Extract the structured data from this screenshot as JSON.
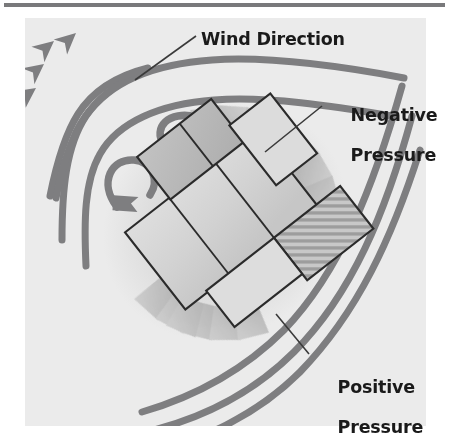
{
  "figure": {
    "type": "diagram",
    "panel_background_color": "#ebebeb",
    "page_background_color": "#ffffff",
    "rule_color": "#6e6e70",
    "flow_line_color": "#7a7a7c",
    "building_fill_color": "#d6d6d6",
    "building_stroke_color": "#2b2b2b",
    "wake_shadow_color": "#b8b8b8",
    "label_color": "#1a1a1a"
  },
  "labels": {
    "wind_direction": "Wind Direction",
    "negative_pressure_line1": "Negative",
    "negative_pressure_line2": "Pressure",
    "positive_pressure_line1": "Positive",
    "positive_pressure_line2": "Pressure"
  },
  "annotations": {
    "leader_lines": 3,
    "flow_arrowheads": 4,
    "eddy_arrows": 2,
    "streamlines": 4
  }
}
